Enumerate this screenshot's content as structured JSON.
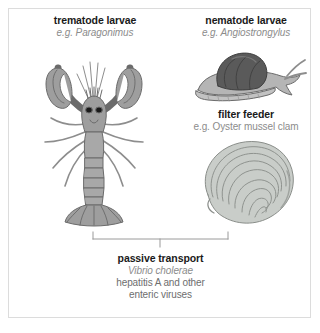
{
  "figure": {
    "background_color": "#ffffff",
    "border_color": "#dcdcdc"
  },
  "palette": {
    "title_color": "#1a1a1a",
    "subtitle_color": "#8c8c8c",
    "body_text_color": "#6e6e6e",
    "creature_fill": "#9e9e9e",
    "creature_fill_light": "#b5b5b5",
    "creature_outline": "#6b6b6b",
    "shell_dark": "#5a5a5a",
    "oyster_fill": "#c9cdc9",
    "oyster_outline": "#8a8e8a",
    "bracket_color": "#9a9a9a"
  },
  "groups": [
    {
      "id": "trematode",
      "title": "trematode larvae",
      "subtitle": "e.g. Paragonimus",
      "subtitle_italic": true,
      "illustration": "lobster-illustration"
    },
    {
      "id": "nematode",
      "title": "nematode larvae",
      "subtitle": "e.g. Angiostrongylus",
      "subtitle_italic": true,
      "illustration": "snail-illustration"
    },
    {
      "id": "filter_feeder",
      "title": "filter feeder",
      "subtitle": "e.g. Oyster mussel clam",
      "subtitle_italic": false,
      "illustration": "oyster-illustration"
    }
  ],
  "passive_transport": {
    "title": "passive transport",
    "pathogen_italic": "Vibrio cholerae",
    "line3": "hepatitis A and other",
    "line4": "enteric viruses"
  }
}
